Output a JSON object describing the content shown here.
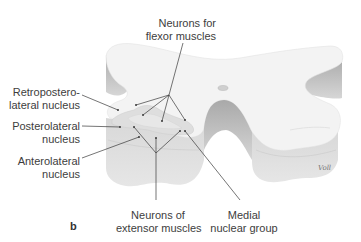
{
  "figure": {
    "panel_letter": "b",
    "signature": "Voll"
  },
  "labels": {
    "flexor": {
      "line1": "Neurons for",
      "line2": "flexor muscles"
    },
    "retropostero": {
      "line1": "Retropostero-",
      "line2": "lateral nucleus"
    },
    "posterolateral": {
      "line1": "Posterolateral",
      "line2": "nucleus"
    },
    "anterolateral": {
      "line1": "Anterolateral",
      "line2": "nucleus"
    },
    "extensor": {
      "line1": "Neurons of",
      "line2": "extensor muscles"
    },
    "medial": {
      "line1": "Medial",
      "line2": "nuclear group"
    }
  },
  "colors": {
    "top_surface": "#f3f3f3",
    "side_dark": "#b9b9b9",
    "side_mid": "#d2d2d2",
    "gray_matter": "#dcdcdc",
    "leader_line": "#3a3a3a",
    "text": "#3d3d3d"
  }
}
